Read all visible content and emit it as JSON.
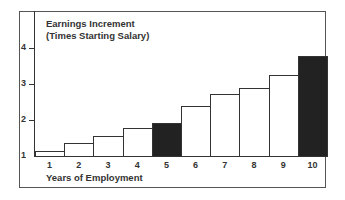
{
  "chart_data": {
    "type": "bar",
    "title_lines": [
      "Earnings Increment",
      "(Times Starting Salary)"
    ],
    "xlabel": "Years of Employment",
    "ylabel": "Earnings Increment (Times Starting Salary)",
    "categories": [
      "1",
      "2",
      "3",
      "4",
      "5",
      "6",
      "7",
      "8",
      "9",
      "10"
    ],
    "values": [
      1.14,
      1.36,
      1.56,
      1.78,
      1.92,
      2.39,
      2.72,
      2.89,
      3.25,
      3.78
    ],
    "highlighted": [
      5,
      10
    ],
    "highlight_color": "#222222",
    "bar_color": "#ffffff",
    "yticks": [
      1,
      2,
      3,
      4
    ],
    "ylim": [
      1,
      4.9
    ],
    "grid": false,
    "legend": null
  }
}
